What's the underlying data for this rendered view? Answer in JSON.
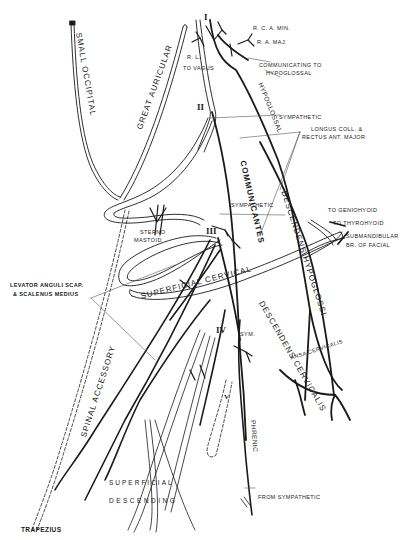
{
  "figure": {
    "colors": {
      "ink": "#1a1a1a",
      "background": "#ffffff",
      "leader": "#555555"
    }
  },
  "roots": [
    {
      "id": "I",
      "label": "I"
    },
    {
      "id": "II",
      "label": "II"
    },
    {
      "id": "III",
      "label": "III"
    },
    {
      "id": "IV",
      "label": "IV"
    },
    {
      "id": "V",
      "label": "V"
    }
  ],
  "labels": {
    "rca_min": "R. C. A. MIN.",
    "ra_maj": "R. A. MAJ.",
    "rl": "R. L.",
    "to_vagus": "TO VAGUS",
    "communicating_to": "COMMUNICATING TO",
    "hypoglossal_comm": "HYPOGLOSSAL",
    "small_occipital": "SMALL OCCIPITAL",
    "great_auricular": "GREAT AURICULAR",
    "hypoglossal": "HYPOGLOSSAL",
    "sympathetic_ii": "SYMPATHETIC",
    "longus_coll_1": "LONGUS COLL. &",
    "longus_coll_2": "RECTUS ANT. MAJOR",
    "communicantes": "COMMUNICANTES",
    "sympathetic_iii": "SYMPATHETIC",
    "sterno": "STERNO",
    "mastoid": "MASTOID",
    "to_geniohyoid": "TO GENIOHYOID",
    "to_thyrohyoid": "TO THYROHYOID",
    "submandibular_1": "SUBMANDIBULAR",
    "submandibular_2": "BR. OF FACIAL",
    "descendens_hypoglossi": "DESCENDENS HYPOGLOSSI",
    "levator_1": "LEVATOR ANGULI SCAP.",
    "levator_2": "& SCALENUS MEDIUS",
    "superficial_cervical": "SUPERFICIAL CERVICAL",
    "spinal_accessory": "SPINAL ACCESSORY",
    "sym": "SYM.",
    "descendens_cervicalis": "DESCENDENS CERVICALIS",
    "ansa_cervicalis": "ANSA CERVICALIS",
    "phrenic": "PHRENIC",
    "superficial": "SUPERFICIAL",
    "descending": "DESCENDING",
    "from_sympathetic": "FROM SYMPATHETIC",
    "trapezius": "TRAPEZIUS"
  }
}
